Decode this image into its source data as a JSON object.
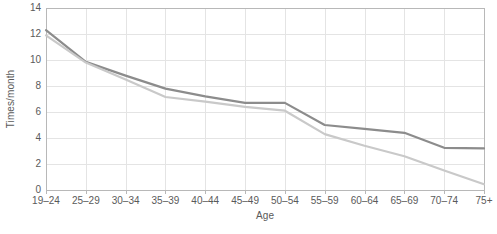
{
  "chart_data": {
    "type": "line",
    "title": "",
    "xlabel": "Age",
    "ylabel": "Times/month",
    "categories": [
      "19–24",
      "25–29",
      "30–34",
      "35–39",
      "40–44",
      "45–49",
      "50–54",
      "55–59",
      "60–64",
      "65–69",
      "70–74",
      "75+"
    ],
    "ylim": [
      0,
      14
    ],
    "yticks": [
      0,
      2,
      4,
      6,
      8,
      10,
      12,
      14
    ],
    "ytick_labels": [
      "0",
      "2",
      "4",
      "6",
      "8",
      "10",
      "12",
      "14"
    ],
    "grid": true,
    "legend": "none",
    "series": [
      {
        "name": "dark-series",
        "color": "#8c8c8c",
        "values": [
          12.3,
          9.85,
          8.8,
          7.8,
          7.2,
          6.7,
          6.7,
          5.0,
          4.7,
          4.4,
          3.25,
          3.2
        ]
      },
      {
        "name": "light-series",
        "color": "#c9c9c9",
        "values": [
          11.9,
          9.8,
          8.5,
          7.15,
          6.8,
          6.4,
          6.1,
          4.3,
          3.4,
          2.6,
          1.5,
          0.45
        ]
      }
    ],
    "axis_color": "#b8b8b8",
    "grid_color": "#e4e4e4",
    "text_color": "#5a5a5a",
    "background": "#ffffff"
  }
}
